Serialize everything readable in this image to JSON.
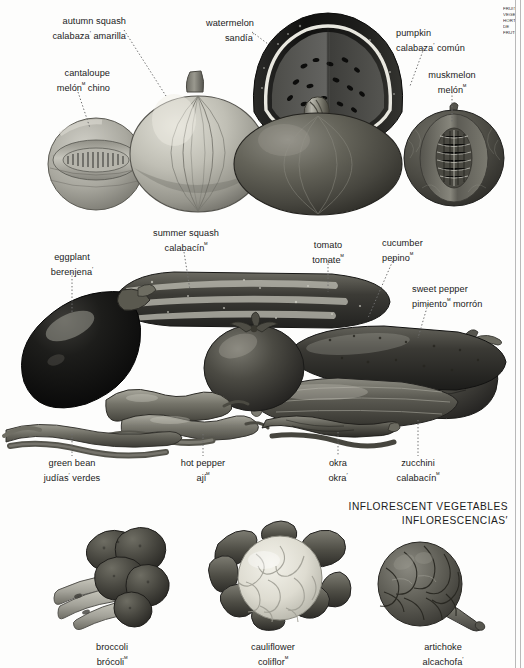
{
  "page": {
    "background": "#fdfdfc",
    "rule_color": "#b9b9b9",
    "ink": "#1b1b1b",
    "leader_color": "#6f6f6f",
    "side_text": "FRUIT VEGETABLES HORTALIZAS DE FRUTO"
  },
  "sections": [
    {
      "id": "fruit-vegetables-top",
      "labels": [
        {
          "id": "autumn-squash",
          "en": "autumn squash",
          "es": "calabaza",
          "es_suffix": "′",
          "es_tail": " amarilla"
        },
        {
          "id": "watermelon",
          "en": "watermelon",
          "es": "sandía",
          "es_suffix": "′",
          "es_tail": ""
        },
        {
          "id": "pumpkin",
          "en": "pumpkin",
          "es": "calabaza",
          "es_suffix": "′",
          "es_tail": " común"
        },
        {
          "id": "cantaloupe",
          "en": "cantaloupe",
          "es": "melón",
          "es_suffix": "ᴹ",
          "es_tail": " chino"
        },
        {
          "id": "muskmelon",
          "en": "muskmelon",
          "es": "melón",
          "es_suffix": "ᴹ",
          "es_tail": ""
        }
      ]
    },
    {
      "id": "fruit-vegetables-middle",
      "labels": [
        {
          "id": "summer-squash",
          "en": "summer squash",
          "es": "calabacín",
          "es_suffix": "ᴹ",
          "es_tail": ""
        },
        {
          "id": "eggplant",
          "en": "eggplant",
          "es": "berenjena",
          "es_suffix": "′",
          "es_tail": ""
        },
        {
          "id": "tomato",
          "en": "tomato",
          "es": "tomate",
          "es_suffix": "ᴹ",
          "es_tail": ""
        },
        {
          "id": "cucumber",
          "en": "cucumber",
          "es": "pepino",
          "es_suffix": "ᴹ",
          "es_tail": ""
        },
        {
          "id": "sweet-pepper",
          "en": "sweet pepper",
          "es": "pimiento",
          "es_suffix": "ᴹ",
          "es_tail": " morrón"
        },
        {
          "id": "green-bean",
          "en": "green bean",
          "es": "judías",
          "es_suffix": "′",
          "es_tail": " verdes"
        },
        {
          "id": "hot-pepper",
          "en": "hot pepper",
          "es": "ají",
          "es_suffix": "ᴹ",
          "es_tail": ""
        },
        {
          "id": "okra",
          "en": "okra",
          "es": "okra",
          "es_suffix": "′",
          "es_tail": ""
        },
        {
          "id": "zucchini",
          "en": "zucchini",
          "es": "calabacín",
          "es_suffix": "ᴹ",
          "es_tail": ""
        }
      ]
    },
    {
      "id": "inflorescent-vegetables",
      "heading": {
        "en": "INFLORESCENT VEGETABLES",
        "es": "INFLORESCENCIAS",
        "es_suffix": "′"
      },
      "labels": [
        {
          "id": "broccoli",
          "en": "broccoli",
          "es": "brócoli",
          "es_suffix": "ᴹ",
          "es_tail": ""
        },
        {
          "id": "cauliflower",
          "en": "cauliflower",
          "es": "coliflor",
          "es_suffix": "ᴹ",
          "es_tail": ""
        },
        {
          "id": "artichoke",
          "en": "artichoke",
          "es": "alcachofa",
          "es_suffix": "′",
          "es_tail": ""
        }
      ]
    }
  ],
  "illustrations": [
    {
      "id": "cantaloupe-illustration",
      "name": "cantaloupe"
    },
    {
      "id": "autumn-squash-illustration",
      "name": "autumn squash"
    },
    {
      "id": "watermelon-illustration",
      "name": "watermelon"
    },
    {
      "id": "pumpkin-illustration",
      "name": "pumpkin"
    },
    {
      "id": "muskmelon-illustration",
      "name": "muskmelon"
    },
    {
      "id": "eggplant-illustration",
      "name": "eggplant"
    },
    {
      "id": "summer-squash-illustration",
      "name": "summer squash"
    },
    {
      "id": "tomato-illustration",
      "name": "tomato"
    },
    {
      "id": "cucumber-illustration",
      "name": "cucumber"
    },
    {
      "id": "sweet-pepper-illustration",
      "name": "sweet pepper"
    },
    {
      "id": "zucchini-illustration",
      "name": "zucchini"
    },
    {
      "id": "green-bean-illustration",
      "name": "green bean"
    },
    {
      "id": "hot-pepper-illustration",
      "name": "hot pepper"
    },
    {
      "id": "okra-illustration",
      "name": "okra"
    },
    {
      "id": "broccoli-illustration",
      "name": "broccoli"
    },
    {
      "id": "cauliflower-illustration",
      "name": "cauliflower"
    },
    {
      "id": "artichoke-illustration",
      "name": "artichoke"
    }
  ]
}
